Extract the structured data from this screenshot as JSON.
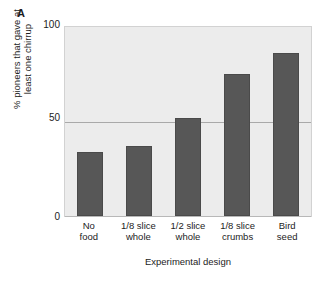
{
  "panel": {
    "label": "A"
  },
  "chart_data": {
    "type": "bar",
    "title": "",
    "subtitle": "",
    "xlabel": "Experimental design",
    "ylabel": "% pioneers that gave at least one chirrup",
    "ylabel_lines": [
      "% pioneers that gave at",
      "least one chirrup"
    ],
    "categories": [
      "No food",
      "1/8 slice whole",
      "1/2 slice whole",
      "1/8 slice crumbs",
      "Bird seed"
    ],
    "category_lines": [
      [
        "No",
        "food"
      ],
      [
        "1/8 slice",
        "whole"
      ],
      [
        "1/2 slice",
        "whole"
      ],
      [
        "1/8 slice",
        "crumbs"
      ],
      [
        "Bird",
        "seed"
      ]
    ],
    "values": [
      34,
      37,
      52,
      75,
      86
    ],
    "ylim": [
      0,
      100
    ],
    "yticks": [
      0,
      50,
      100
    ],
    "ytick_labels": [
      "0",
      "50",
      "100"
    ],
    "grid": true,
    "gridlines_at": [
      50
    ],
    "legend": "none",
    "bar_color": "#575757",
    "plot_background": "#ececec",
    "gridline_color": "#a9a9a9"
  },
  "axis": {
    "y_tick_0": "0",
    "y_tick_50": "50",
    "y_tick_100": "100",
    "y_title_line1": "% pioneers that gave at",
    "y_title_line2": "least one chirrup",
    "x_title": "Experimental design"
  },
  "xlabels": [
    {
      "line1": "No",
      "line2": "food"
    },
    {
      "line1": "1/8 slice",
      "line2": "whole"
    },
    {
      "line1": "1/2 slice",
      "line2": "whole"
    },
    {
      "line1": "1/8 slice",
      "line2": "crumbs"
    },
    {
      "line1": "Bird",
      "line2": "seed"
    }
  ]
}
